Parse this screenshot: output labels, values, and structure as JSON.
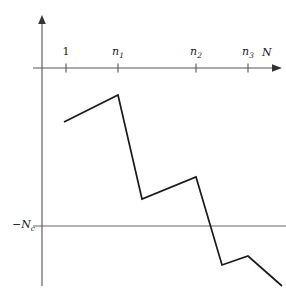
{
  "figure": {
    "title": "",
    "width": 286,
    "height": 298,
    "background": "#ffffff"
  },
  "axes": {
    "x_axis": {
      "label": "N",
      "origin_x": 42,
      "y": 68,
      "start_x": 33,
      "end_x": 278,
      "arrow": true,
      "color": "#555555"
    },
    "y_axis": {
      "label": "",
      "x": 42,
      "top_y": 17,
      "bottom_y": 286,
      "arrow": true,
      "color": "#555555"
    },
    "ticks": [
      {
        "label": "1",
        "sub": "",
        "x": 66,
        "italic": false
      },
      {
        "label": "n",
        "sub": "1",
        "x": 118,
        "italic": true
      },
      {
        "label": "n",
        "sub": "2",
        "x": 196,
        "italic": true
      },
      {
        "label": "n",
        "sub": "3",
        "x": 248,
        "italic": true
      }
    ],
    "threshold": {
      "label": "−N",
      "sub": "c",
      "y": 226,
      "start_x": 33,
      "end_x": 286,
      "color": "#666666"
    }
  },
  "chart_data": {
    "type": "line",
    "title": "",
    "xlabel": "N",
    "ylabel": "−N_c",
    "grid": false,
    "legend": null,
    "series": [
      {
        "name": "sawtooth-trajectory",
        "color": "#1a1a1a",
        "points": [
          [
            64,
            122
          ],
          [
            118,
            95
          ],
          [
            142,
            199
          ],
          [
            196,
            177
          ],
          [
            222,
            265
          ],
          [
            248,
            256
          ],
          [
            282,
            286
          ]
        ]
      }
    ],
    "annotations": [
      {
        "text": "1",
        "x": 66,
        "y": 57
      },
      {
        "text": "n1",
        "x": 118,
        "y": 57
      },
      {
        "text": "n2",
        "x": 196,
        "y": 57
      },
      {
        "text": "n3",
        "x": 248,
        "y": 57
      },
      {
        "text": "N",
        "x": 263,
        "y": 55
      },
      {
        "text": "-Nc",
        "x": 14,
        "y": 220
      }
    ]
  }
}
